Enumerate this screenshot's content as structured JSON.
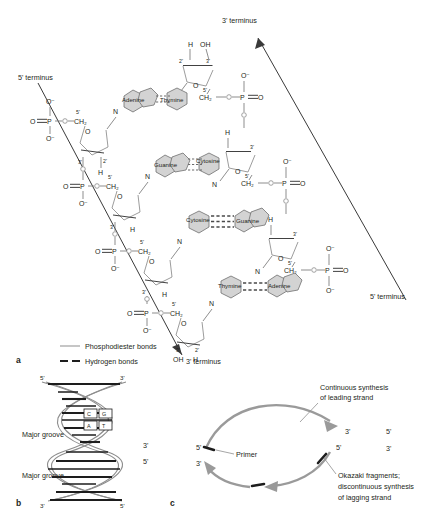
{
  "figure": {
    "panels": [
      {
        "id": "a",
        "label": "a"
      },
      {
        "id": "b",
        "label": "b"
      },
      {
        "id": "c",
        "label": "c"
      }
    ]
  },
  "panel_a": {
    "termini": {
      "five_prime_left": "5' terminus",
      "three_prime_top": "3' terminus",
      "three_prime_bottom": "3' terminus",
      "five_prime_right": "5' terminus"
    },
    "base_pairs": [
      {
        "left": "Adenine",
        "right": "Thymine"
      },
      {
        "left": "Guanine",
        "right": "Cytosine"
      },
      {
        "left": "Cytosine",
        "right": "Guanine"
      },
      {
        "left": "Thymine",
        "right": "Adenine"
      }
    ],
    "atoms": {
      "phosphorus": "P",
      "oxygen": "O",
      "oxygen_minus": "O⁻",
      "nitrogen": "N",
      "hydrogen": "H",
      "hydroxyl": "OH",
      "methylene": "CH₂",
      "c2": "2'",
      "c3": "3'",
      "c5": "5'"
    },
    "legend": [
      {
        "key": "phosphodiester",
        "label": "Phosphodiester bonds",
        "style": "solid-line"
      },
      {
        "key": "hydrogen",
        "label": "Hydrogen bonds",
        "style": "dashed-line"
      }
    ]
  },
  "panel_b": {
    "grooves": [
      "Major groove",
      "Major groove"
    ],
    "base_pair_labels": [
      {
        "left": "C",
        "right": "G"
      },
      {
        "left": "A",
        "right": "T"
      }
    ],
    "end_labels": {
      "top_left": "5'",
      "top_right": "3'",
      "bottom_left": "3'",
      "bottom_right": "5'"
    },
    "side_labels": [
      "3'",
      "5'"
    ]
  },
  "panel_c": {
    "annotations": [
      {
        "key": "leading",
        "text": "Continuous synthesis\nof leading strand",
        "line1": "Continuous synthesis",
        "line2": "of leading strand"
      },
      {
        "key": "primer",
        "text": "Primer"
      },
      {
        "key": "okazaki",
        "line1": "Okazaki fragments;",
        "line2": "discontinuous synthesis",
        "line3": "of lagging strand"
      }
    ],
    "strand_ends": {
      "fork_left_top": "5'",
      "fork_left_bottom": "3'",
      "fork_right_top": "3'",
      "fork_right_bottom": "5'",
      "template_top": "5'",
      "template_bottom": "3'"
    }
  },
  "colors": {
    "base_ring_fill": "#d3d3d3",
    "base_ring_stroke": "#6e6e6e",
    "bond": "#7a7a7a",
    "hydrogen_bond": "#4a4a4a",
    "arrow_gray": "#9a9a9a",
    "text": "#231f20"
  }
}
